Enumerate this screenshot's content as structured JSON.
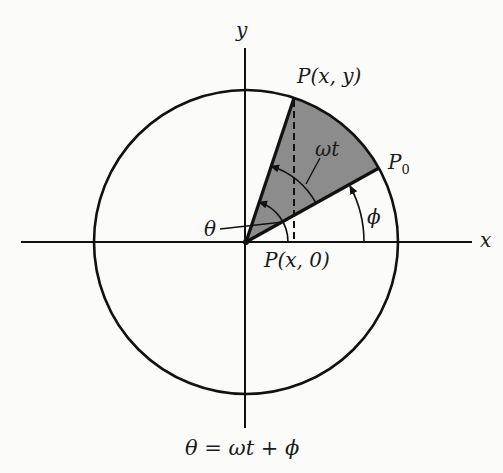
{
  "diagram": {
    "axes": {
      "x_label": "x",
      "y_label": "y"
    },
    "points": {
      "p": "P(x, y)",
      "p0": "P",
      "p0_sub": "0",
      "foot": "P(x, 0)"
    },
    "angles": {
      "omega_t": "ωt",
      "phi": "ϕ",
      "theta": "θ"
    },
    "equation": "θ = ωt + ϕ",
    "colors": {
      "ink": "#111111",
      "sector_fill": "#8c8c8c",
      "background": "#fbfbfa"
    },
    "geometry": {
      "center": [
        246,
        242
      ],
      "radius": 152,
      "angle_P_deg": 71.6,
      "angle_P0_deg": 29.1
    }
  }
}
